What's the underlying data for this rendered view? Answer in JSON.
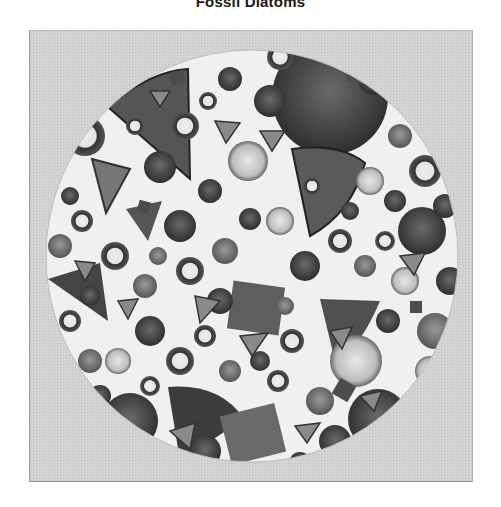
{
  "figure": {
    "title": "Fossil Diatoms",
    "image": {
      "description": "Grayscale photomicrograph of fossil diatoms arranged in a circular mount",
      "background_color": "#d4d4d4",
      "arrangement": "circle",
      "shapes": [
        "circles",
        "triangles",
        "squares",
        "chain forms"
      ]
    }
  }
}
